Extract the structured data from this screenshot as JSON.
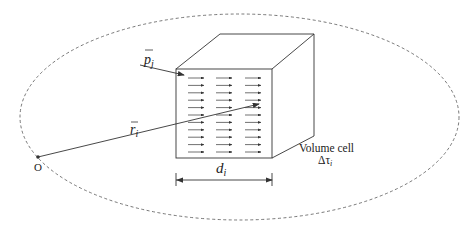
{
  "diagram": {
    "labels": {
      "dipole": "p",
      "dipole_sub": "j",
      "position": "r",
      "position_sub": "i",
      "origin": "O",
      "cell_name": "Volume cell",
      "cell_symbol": "Δτ",
      "cell_sub": "i",
      "width": "d",
      "width_sub": "i"
    },
    "colors": {
      "stroke": "#333333",
      "background": "#ffffff"
    },
    "arrow_grid": {
      "rows": 11,
      "columns": 3
    }
  }
}
